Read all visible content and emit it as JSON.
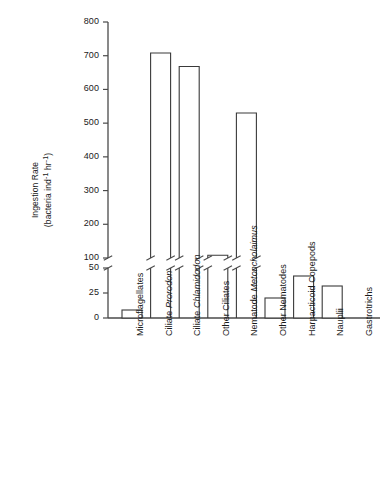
{
  "chart_data": {
    "type": "bar",
    "title": "",
    "xlabel": "",
    "ylabel": "Ingestion Rate (bacteria ind-1 hr-1)",
    "ylabel_line1": "Ingestion Rate",
    "ylabel_line2": "(bacteria ind",
    "ylabel_sup1": "-1",
    "ylabel_mid": " hr",
    "ylabel_sup2": "-1",
    "ylabel_end": ")",
    "categories": [
      "Microflagellates",
      "Ciliate Prorodon",
      "Ciliate Chlamidodon",
      "Other Ciliates",
      "Nematode Metoncholaimus",
      "Other Nematodes",
      "Harpacticoid Copepods",
      "Nauplii",
      "Gastrotrichs"
    ],
    "category_parts": [
      {
        "plain": "Microflagellates",
        "italic": ""
      },
      {
        "plain": "Ciliate ",
        "italic": "Prorodon"
      },
      {
        "plain": "Ciliate ",
        "italic": "Chlamidodon"
      },
      {
        "plain": "Other Ciliates",
        "italic": ""
      },
      {
        "plain": "Nematode ",
        "italic": "Metoncholaimus"
      },
      {
        "plain": "Other Nematodes",
        "italic": ""
      },
      {
        "plain": "Harpacticoid Copepods",
        "italic": ""
      },
      {
        "plain": "Nauplii",
        "italic": ""
      },
      {
        "plain": "Gastrotrichs",
        "italic": ""
      }
    ],
    "values": [
      8,
      708,
      668,
      108,
      530,
      20,
      42,
      32,
      0
    ],
    "broken_axis": true,
    "axis_break_between": [
      50,
      100
    ],
    "lower_ticks": [
      0,
      25,
      50
    ],
    "lower_tick_labels": [
      "0",
      "25",
      "50"
    ],
    "upper_ticks": [
      100,
      200,
      300,
      400,
      500,
      600,
      700,
      800
    ],
    "upper_tick_labels": [
      "100",
      "200",
      "300",
      "400",
      "500",
      "600",
      "700",
      "800"
    ],
    "ylim_lower": [
      0,
      50
    ],
    "ylim_upper": [
      100,
      800
    ],
    "grid": false,
    "legend": null,
    "bar_fill": "#ffffff",
    "bar_edge": "#3a3a3a",
    "axis_color": "#4a4a4a",
    "text_color": "#1a1a1a",
    "background": "#ffffff"
  }
}
